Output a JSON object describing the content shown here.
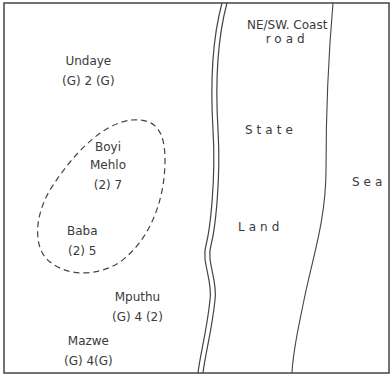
{
  "map": {
    "road_label_line1": "NE/SW. Coast",
    "road_label_line2": "road",
    "region_label_line1": "State",
    "region_label_line2": "Land",
    "sea_label": "Sea",
    "homesteads": [
      {
        "name": "Undaye",
        "code": "(G) 2 (G)"
      },
      {
        "name_line1": "Boyi",
        "name_line2": "Mehlo",
        "code": "(2) 7"
      },
      {
        "name": "Baba",
        "code": "(2) 5"
      },
      {
        "name": "Mputhu",
        "code": "(G) 4 (2)"
      },
      {
        "name": "Mazwe",
        "code": "(G) 4(G)"
      }
    ]
  }
}
